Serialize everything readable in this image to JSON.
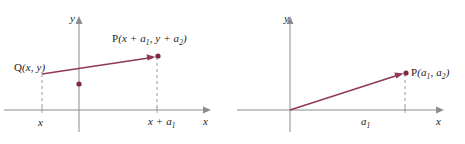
{
  "figure": {
    "colors": {
      "axis": "#8c8c8c",
      "vector": "#8e3b52",
      "point": "#7d2a42",
      "dashed": "#9a9a9a",
      "text": "#1c1c1c",
      "background": "#ffffff"
    }
  },
  "left_panel": {
    "name": "translated-vector-diagram",
    "y_axis_label": "y",
    "x_axis_label": "x",
    "point_p": {
      "label_prefix": "P",
      "label_full": "P(x + a1, y + a2)",
      "coord_x_main": "x + a",
      "coord_x_sub": "1",
      "coord_y_main": "y + a",
      "coord_y_sub": "2"
    },
    "point_q": {
      "label_prefix": "Q",
      "label_full": "Q(x, y)",
      "coord_x": "x",
      "coord_y": "y"
    },
    "x_tick_left": "x",
    "x_tick_right_main": "x + a",
    "x_tick_right_sub": "1"
  },
  "right_panel": {
    "name": "position-vector-diagram",
    "y_axis_label": "y",
    "x_axis_label": "x",
    "point_p": {
      "label_prefix": "P",
      "label_full": "P(a1, a2)",
      "coord_x_main": "a",
      "coord_x_sub": "1",
      "coord_y_main": "a",
      "coord_y_sub": "2"
    },
    "x_span_label_main": "a",
    "x_span_label_sub": "1"
  }
}
